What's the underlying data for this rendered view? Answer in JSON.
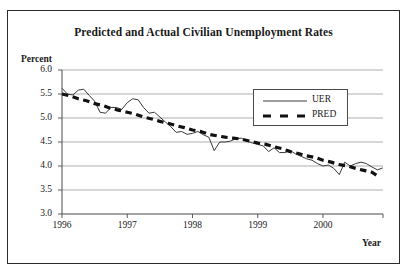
{
  "chart_data": {
    "type": "line",
    "title": "Predicted and Actual Civilian Unemployment Rates",
    "xlabel": "Year",
    "ylabel": "Percent",
    "ylim": [
      3.0,
      6.0
    ],
    "xlim": [
      1996.0,
      2000.92
    ],
    "grid": true,
    "legend_position": "upper-right-inside",
    "yticks": [
      "6.0",
      "5.5",
      "5.0",
      "4.5",
      "4.0",
      "3.5",
      "3.0"
    ],
    "ytick_values": [
      6.0,
      5.5,
      5.0,
      4.5,
      4.0,
      3.5,
      3.0
    ],
    "xticks": [
      "1996",
      "1997",
      "1998",
      "1999",
      "2000"
    ],
    "xtick_values": [
      1996,
      1997,
      1998,
      1999,
      2000
    ],
    "series": [
      {
        "name": "UER",
        "style": "solid-thin",
        "color": "#3a3a3a",
        "x": [
          1996.0,
          1996.083,
          1996.167,
          1996.25,
          1996.333,
          1996.417,
          1996.5,
          1996.583,
          1996.667,
          1996.75,
          1996.833,
          1996.917,
          1997.0,
          1997.083,
          1997.167,
          1997.25,
          1997.333,
          1997.417,
          1997.5,
          1997.583,
          1997.667,
          1997.75,
          1997.833,
          1997.917,
          1998.0,
          1998.083,
          1998.167,
          1998.25,
          1998.333,
          1998.417,
          1998.5,
          1998.583,
          1998.667,
          1998.75,
          1998.833,
          1998.917,
          1999.0,
          1999.083,
          1999.167,
          1999.25,
          1999.333,
          1999.417,
          1999.5,
          1999.583,
          1999.667,
          1999.75,
          1999.833,
          1999.917,
          2000.0,
          2000.083,
          2000.167,
          2000.25,
          2000.333,
          2000.417,
          2000.5,
          2000.583,
          2000.667,
          2000.75,
          2000.833,
          2000.917
        ],
        "values": [
          5.62,
          5.5,
          5.48,
          5.58,
          5.6,
          5.47,
          5.35,
          5.12,
          5.1,
          5.22,
          5.22,
          5.18,
          5.32,
          5.4,
          5.38,
          5.22,
          5.1,
          5.12,
          5.02,
          4.92,
          4.82,
          4.7,
          4.72,
          4.66,
          4.68,
          4.72,
          4.65,
          4.6,
          4.32,
          4.5,
          4.5,
          4.52,
          4.57,
          4.58,
          4.52,
          4.48,
          4.45,
          4.42,
          4.3,
          4.38,
          4.28,
          4.28,
          4.32,
          4.25,
          4.2,
          4.15,
          4.12,
          4.05,
          4.0,
          4.02,
          3.95,
          3.82,
          4.08,
          4.0,
          4.05,
          4.08,
          4.05,
          3.98,
          3.92,
          3.96
        ]
      },
      {
        "name": "PRED",
        "style": "dashed-thick",
        "color": "#111111",
        "x": [
          1996.0,
          1996.125,
          1996.25,
          1996.375,
          1996.5,
          1996.625,
          1996.75,
          1996.875,
          1997.0,
          1997.125,
          1997.25,
          1997.375,
          1997.5,
          1997.625,
          1997.75,
          1997.875,
          1998.0,
          1998.125,
          1998.25,
          1998.375,
          1998.5,
          1998.625,
          1998.75,
          1998.875,
          1999.0,
          1999.125,
          1999.25,
          1999.375,
          1999.5,
          1999.625,
          1999.75,
          1999.875,
          2000.0,
          2000.125,
          2000.25,
          2000.375,
          2000.5,
          2000.625,
          2000.75,
          2000.875
        ],
        "values": [
          5.5,
          5.46,
          5.4,
          5.36,
          5.3,
          5.26,
          5.2,
          5.16,
          5.12,
          5.08,
          5.02,
          4.98,
          4.93,
          4.89,
          4.84,
          4.8,
          4.75,
          4.72,
          4.66,
          4.63,
          4.6,
          4.58,
          4.56,
          4.52,
          4.48,
          4.45,
          4.4,
          4.36,
          4.3,
          4.26,
          4.21,
          4.18,
          4.12,
          4.08,
          4.03,
          4.0,
          3.95,
          3.91,
          3.87,
          3.76
        ]
      }
    ]
  },
  "legend": {
    "entries": [
      {
        "label": "UER"
      },
      {
        "label": "PRED"
      }
    ]
  }
}
